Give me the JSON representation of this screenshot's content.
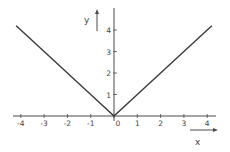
{
  "chart_data": {
    "type": "line",
    "title": "",
    "xlabel": "x",
    "ylabel": "y",
    "function": "y = |x|",
    "x": [
      -4.2,
      -4,
      -3,
      -2,
      -1,
      0,
      1,
      2,
      3,
      4,
      4.2
    ],
    "series": [
      {
        "name": "y = |x|",
        "x": [
          -4.2,
          -4,
          -3,
          -2,
          -1,
          0,
          1,
          2,
          3,
          4,
          4.2
        ],
        "values": [
          4.2,
          4,
          3,
          2,
          1,
          0,
          1,
          2,
          3,
          4,
          4.2
        ]
      }
    ],
    "xlim": [
      -4.3,
      4.4
    ],
    "ylim": [
      -0.2,
      5
    ],
    "x_ticks": [
      "-4",
      "-3",
      "-2",
      "-1",
      "0",
      "1",
      "2",
      "3",
      "4"
    ],
    "y_ticks": [
      "1",
      "2",
      "3",
      "4"
    ],
    "grid": false,
    "legend": null
  },
  "colors": {
    "line": "#3a3a3a",
    "axis": "#4a4a4a",
    "text": "#444444",
    "background": "#ffffff"
  }
}
